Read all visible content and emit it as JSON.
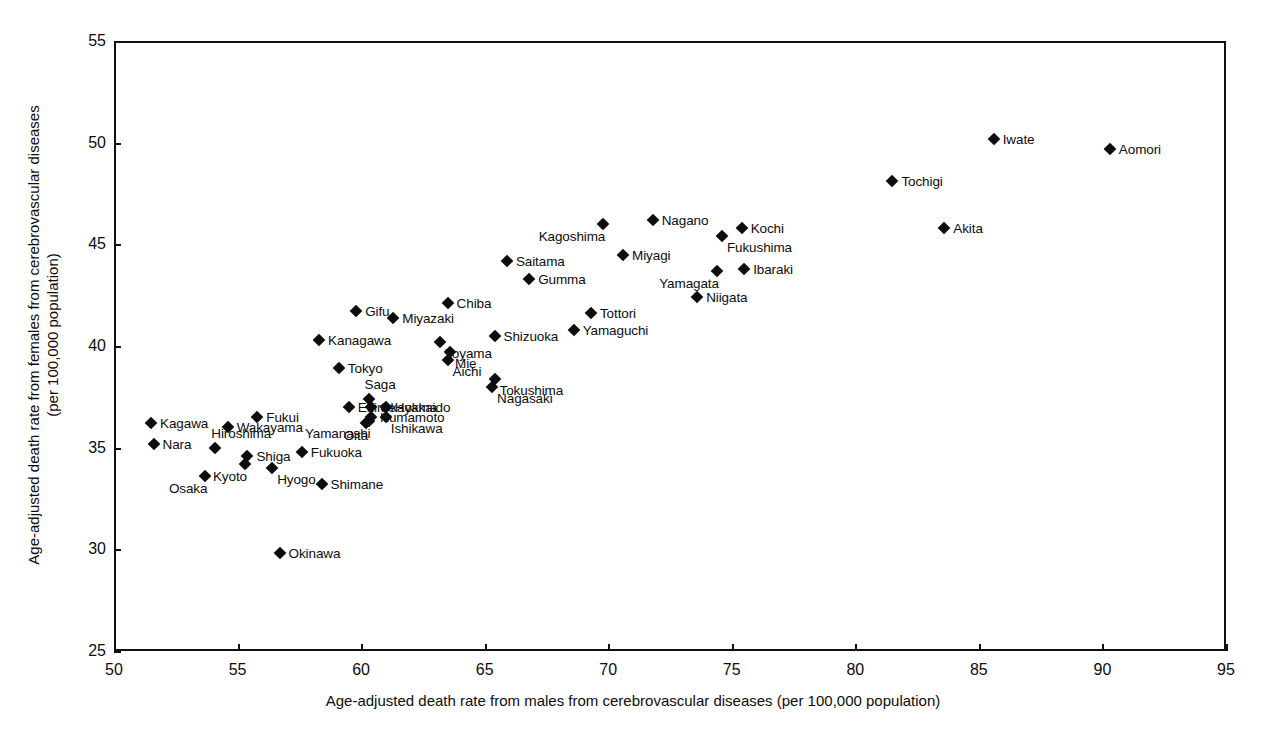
{
  "chart_data": {
    "type": "scatter",
    "title": "",
    "xlabel": "Age-adjusted death rate from males from cerebrovascular diseases (per 100,000 population)",
    "ylabel_line1": "Age-adjusted death rate from females from cerebrovascular diseases",
    "ylabel_line2": "(per 100,000 population)",
    "xlim": [
      50,
      95
    ],
    "ylim": [
      25,
      55
    ],
    "xticks": [
      "50",
      "55",
      "60",
      "65",
      "70",
      "75",
      "80",
      "85",
      "90",
      "95"
    ],
    "yticks": [
      "25",
      "30",
      "35",
      "40",
      "45",
      "50",
      "55"
    ],
    "grid": false,
    "legend": "none",
    "marker": "filled-diamond",
    "marker_color": "#0d0d0d",
    "point_label_field": "prefecture",
    "points": [
      {
        "prefecture": "Aomori",
        "x": 90.3,
        "y": 49.7,
        "label_pos": "right"
      },
      {
        "prefecture": "Iwate",
        "x": 85.6,
        "y": 50.2,
        "label_pos": "right"
      },
      {
        "prefecture": "Tochigi",
        "x": 81.5,
        "y": 48.1,
        "label_pos": "right"
      },
      {
        "prefecture": "Akita",
        "x": 83.6,
        "y": 45.8,
        "label_pos": "right"
      },
      {
        "prefecture": "Kochi",
        "x": 75.4,
        "y": 45.8,
        "label_pos": "right"
      },
      {
        "prefecture": "Nagano",
        "x": 71.8,
        "y": 46.2,
        "label_pos": "right"
      },
      {
        "prefecture": "Kagoshima",
        "x": 69.8,
        "y": 46.0,
        "label_pos": "below-left"
      },
      {
        "prefecture": "Fukushima",
        "x": 74.6,
        "y": 45.4,
        "label_pos": "br"
      },
      {
        "prefecture": "Miyagi",
        "x": 70.6,
        "y": 44.5,
        "label_pos": "right"
      },
      {
        "prefecture": "Saitama",
        "x": 65.9,
        "y": 44.2,
        "label_pos": "right"
      },
      {
        "prefecture": "Ibaraki",
        "x": 75.5,
        "y": 43.8,
        "label_pos": "right"
      },
      {
        "prefecture": "Yamagata",
        "x": 74.4,
        "y": 43.7,
        "label_pos": "below-left"
      },
      {
        "prefecture": "Gumma",
        "x": 66.8,
        "y": 43.3,
        "label_pos": "right"
      },
      {
        "prefecture": "Niigata",
        "x": 73.6,
        "y": 42.4,
        "label_pos": "right"
      },
      {
        "prefecture": "Chiba",
        "x": 63.5,
        "y": 42.1,
        "label_pos": "right"
      },
      {
        "prefecture": "Gifu",
        "x": 59.8,
        "y": 41.7,
        "label_pos": "right"
      },
      {
        "prefecture": "Tottori",
        "x": 69.3,
        "y": 41.6,
        "label_pos": "right"
      },
      {
        "prefecture": "Miyazaki",
        "x": 61.3,
        "y": 41.4,
        "label_pos": "right"
      },
      {
        "prefecture": "Yamaguchi",
        "x": 68.6,
        "y": 40.8,
        "label_pos": "right"
      },
      {
        "prefecture": "Shizuoka",
        "x": 65.4,
        "y": 40.5,
        "label_pos": "right"
      },
      {
        "prefecture": "Kanagawa",
        "x": 58.3,
        "y": 40.3,
        "label_pos": "right"
      },
      {
        "prefecture": "Toyama",
        "x": 63.2,
        "y": 40.2,
        "label_pos": "br"
      },
      {
        "prefecture": "Mie",
        "x": 63.6,
        "y": 39.7,
        "label_pos": "br"
      },
      {
        "prefecture": "Aichi",
        "x": 63.5,
        "y": 39.3,
        "label_pos": "br"
      },
      {
        "prefecture": "Tokyo",
        "x": 59.1,
        "y": 38.9,
        "label_pos": "right"
      },
      {
        "prefecture": "Tokushima",
        "x": 65.4,
        "y": 38.4,
        "label_pos": "br"
      },
      {
        "prefecture": "Nagasaki",
        "x": 65.3,
        "y": 38.0,
        "label_pos": "br"
      },
      {
        "prefecture": "Saga",
        "x": 60.3,
        "y": 37.4,
        "label_pos": "above"
      },
      {
        "prefecture": "Okayama",
        "x": 60.4,
        "y": 37.0,
        "label_pos": "right"
      },
      {
        "prefecture": "Hokkaido",
        "x": 61.0,
        "y": 37.0,
        "label_pos": "right"
      },
      {
        "prefecture": "Ehime",
        "x": 59.5,
        "y": 37.0,
        "label_pos": "right"
      },
      {
        "prefecture": "Kumamoto",
        "x": 60.4,
        "y": 36.5,
        "label_pos": "right"
      },
      {
        "prefecture": "Ishikawa",
        "x": 61.0,
        "y": 36.5,
        "label_pos": "br"
      },
      {
        "prefecture": "Yamanashi",
        "x": 60.3,
        "y": 36.3,
        "label_pos": "below-left"
      },
      {
        "prefecture": "Oita",
        "x": 60.2,
        "y": 36.2,
        "label_pos": "below-left"
      },
      {
        "prefecture": "Fukui",
        "x": 55.8,
        "y": 36.5,
        "label_pos": "right"
      },
      {
        "prefecture": "Kagawa",
        "x": 51.5,
        "y": 36.2,
        "label_pos": "right"
      },
      {
        "prefecture": "Wakayama",
        "x": 54.6,
        "y": 36.0,
        "label_pos": "right"
      },
      {
        "prefecture": "Nara",
        "x": 51.6,
        "y": 35.2,
        "label_pos": "right"
      },
      {
        "prefecture": "Hiroshima",
        "x": 54.1,
        "y": 35.0,
        "label_pos": "above"
      },
      {
        "prefecture": "Fukuoka",
        "x": 57.6,
        "y": 34.8,
        "label_pos": "right"
      },
      {
        "prefecture": "Shiga",
        "x": 55.4,
        "y": 34.6,
        "label_pos": "right"
      },
      {
        "prefecture": "Kyoto",
        "x": 55.3,
        "y": 34.2,
        "label_pos": "below-left"
      },
      {
        "prefecture": "Hyogo",
        "x": 56.4,
        "y": 34.0,
        "label_pos": "br"
      },
      {
        "prefecture": "Osaka",
        "x": 53.7,
        "y": 33.6,
        "label_pos": "below-left"
      },
      {
        "prefecture": "Shimane",
        "x": 58.4,
        "y": 33.2,
        "label_pos": "right"
      },
      {
        "prefecture": "Okinawa",
        "x": 56.7,
        "y": 29.8,
        "label_pos": "right"
      }
    ]
  }
}
